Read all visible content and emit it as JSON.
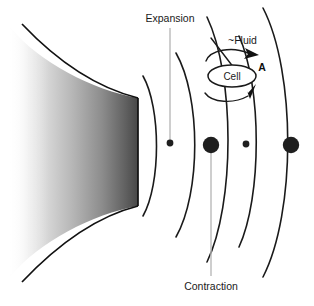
{
  "figure": {
    "title_expansion": "Expansion",
    "title_contraction": "Contraction",
    "label_fluid": "~Fluid",
    "label_cell": "Cell",
    "label_amplitude": "A",
    "colors": {
      "wave_stroke": "#1a1a1a",
      "dot_fill": "#1f1f1f",
      "leader": "#b9b9b9",
      "block_outline": "#111111",
      "gradient_light": "#f7f7f7",
      "gradient_dark": "#4a4a4a",
      "background": "#ffffff"
    },
    "waves": [
      {
        "name": "wave-1",
        "x_top": 142,
        "x_mid": 159,
        "x_bottom": 142,
        "y_top": 76,
        "y_bottom": 216
      },
      {
        "name": "wave-2",
        "x_top": 176,
        "x_mid": 198,
        "x_bottom": 176,
        "y_top": 53,
        "y_bottom": 236
      },
      {
        "name": "wave-3",
        "x_top": 206,
        "x_mid": 230,
        "x_bottom": 206,
        "y_top": 17,
        "y_bottom": 262
      },
      {
        "name": "wave-4",
        "x_top": 238,
        "x_mid": 258,
        "x_bottom": 238,
        "y_top": 36,
        "y_bottom": 247
      },
      {
        "name": "wave-5",
        "x_top": 262,
        "x_mid": 292,
        "x_bottom": 262,
        "y_top": 8,
        "y_bottom": 276
      }
    ],
    "dots": [
      {
        "name": "node-dot-small-1",
        "cx": 170,
        "cy": 143,
        "r": 3.4,
        "size": "small"
      },
      {
        "name": "node-dot-large-1",
        "cx": 211,
        "cy": 145,
        "r": 8.2,
        "size": "large"
      },
      {
        "name": "node-dot-small-2",
        "cx": 246,
        "cy": 144,
        "r": 3.4,
        "size": "small"
      },
      {
        "name": "node-dot-large-2",
        "cx": 291,
        "cy": 145,
        "r": 8.2,
        "size": "large"
      }
    ],
    "leaders": [
      {
        "name": "expansion-leader",
        "x": 170,
        "y1": 28,
        "y2": 143
      },
      {
        "name": "contraction-leader",
        "x": 211,
        "y1": 145,
        "y2": 275
      }
    ],
    "cell": {
      "cx": 232,
      "cy": 75,
      "rx": 24,
      "ry": 11
    },
    "type": "schematic-diagram"
  }
}
